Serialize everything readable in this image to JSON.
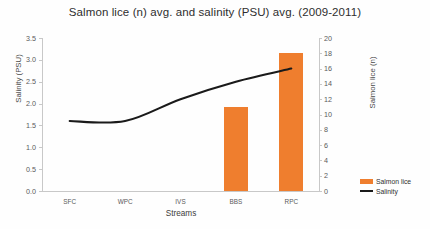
{
  "chart_data": {
    "type": "bar",
    "title": "Salmon lice (n) avg. and salinity (PSU) avg. (2009-2011)",
    "xlabel": "Streams",
    "ylabel": "Salinity (PSU)",
    "ylabel_secondary": "Salmon lice (n)",
    "categories": [
      "SFC",
      "WPC",
      "IVS",
      "BBS",
      "RPC"
    ],
    "ylim": [
      0.0,
      3.5
    ],
    "ylim_secondary": [
      0,
      20
    ],
    "yticks": [
      "3.5",
      "3.0",
      "2.5",
      "2.0",
      "1.5",
      "1.0",
      "0.5",
      "0.0"
    ],
    "yticks_secondary": [
      "20",
      "18",
      "16",
      "14",
      "12",
      "10",
      "8",
      "6",
      "4",
      "2",
      "0"
    ],
    "grid": false,
    "legend_position": "right-bottom",
    "series": [
      {
        "name": "Salmon lice",
        "type": "bar",
        "axis": "secondary",
        "color": "#ef7e2e",
        "values": [
          0,
          0,
          0,
          11,
          18
        ]
      },
      {
        "name": "Salinity",
        "type": "line",
        "axis": "primary",
        "color": "#1a1a1a",
        "values": [
          1.6,
          1.6,
          2.1,
          2.5,
          2.8
        ]
      }
    ]
  },
  "legend": {
    "items": [
      {
        "label": "Salmon lice"
      },
      {
        "label": "Salinity"
      }
    ]
  }
}
